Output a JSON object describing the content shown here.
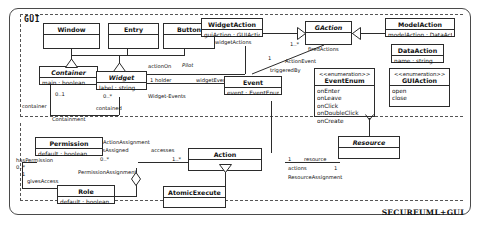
{
  "diagram": {
    "title_corner": "SECUREUML+GUI",
    "package_label": "GUI",
    "inner_labels": {
      "containment": "Containment",
      "widget_events": "Widget-Events",
      "action_event": "ActionEvent",
      "action_assignment": "ActionAssignment",
      "permission_assignment": "PermissionAssignment",
      "resource_assignment": "ResourceAssignment"
    }
  },
  "classes": {
    "window": {
      "name": "Window",
      "abstract": false,
      "attrs": []
    },
    "entry": {
      "name": "Entry",
      "abstract": false,
      "attrs": []
    },
    "button": {
      "name": "Button",
      "abstract": false,
      "attrs": []
    },
    "container": {
      "name": "Container",
      "abstract": true,
      "attrs": [
        "main : boolean"
      ]
    },
    "widget": {
      "name": "Widget",
      "abstract": true,
      "attrs": [
        "label : string"
      ]
    },
    "widget_action": {
      "name": "WidgetAction",
      "abstract": false,
      "attrs": [
        "guiAction : GUIAction"
      ]
    },
    "gaction": {
      "name": "GAction",
      "abstract": true,
      "attrs": []
    },
    "model_action": {
      "name": "ModelAction",
      "abstract": false,
      "attrs": [
        "modelAction : DataAction"
      ]
    },
    "data_action": {
      "name": "DataAction",
      "abstract": false,
      "attrs": [
        "name : string"
      ]
    },
    "event": {
      "name": "Event",
      "abstract": false,
      "attrs": [
        "event : EventEnum"
      ]
    },
    "permission": {
      "name": "Permission",
      "abstract": false,
      "attrs": [
        "default : boolean"
      ]
    },
    "role": {
      "name": "Role",
      "abstract": false,
      "attrs": [
        "default : boolean"
      ]
    },
    "action": {
      "name": "Action",
      "abstract": false,
      "attrs": []
    },
    "resource": {
      "name": "Resource",
      "abstract": true,
      "attrs": []
    },
    "atomic_execute": {
      "name": "AtomicExecute",
      "abstract": false,
      "attrs": []
    }
  },
  "enumerations": {
    "event_enum": {
      "stereotype": "<<enumeration>>",
      "name": "EventEnum",
      "literals": [
        "onEnter",
        "onLeave",
        "onClick",
        "onDoubleClick",
        "onCreate"
      ]
    },
    "gui_action": {
      "stereotype": "<<enumeration>>",
      "name": "GUIAction",
      "literals": [
        "open",
        "close"
      ]
    }
  },
  "association_labels": {
    "container_mult": "0..1",
    "container_role": "container",
    "widget_mult": "0..*",
    "widget_role": "contained",
    "widget_actions": "widgetActions",
    "widget_action_mult": "0..*",
    "action_on": "actionOn",
    "pilot": "Pilot",
    "holder_mult": "1 holder",
    "widget_events": "widgetEvents",
    "widget_events_mult": "*",
    "fired_actions": "firedActions",
    "fired_mult": "1..*",
    "triggered_by": "triggeredBy",
    "triggered_mult": "1",
    "has_permission": "hasPermission",
    "has_permission_mult": "0..*",
    "gives_access": "givesAccess",
    "gives_access_mult": "1",
    "is_assigned": "isAssigned",
    "is_assigned_mult": "0..*",
    "accesses": "accesses",
    "accesses_mult": "1..*",
    "resource_role": "resource",
    "resource_mult": "1",
    "actions_role": "actions",
    "actions_mult": "1"
  }
}
